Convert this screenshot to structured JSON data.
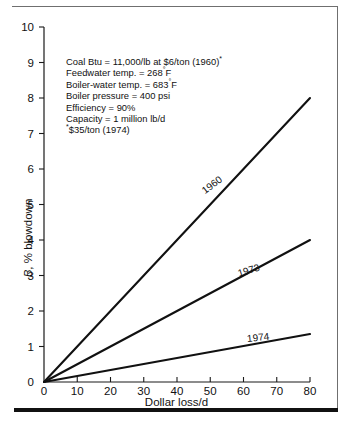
{
  "chart_data": {
    "type": "line",
    "title": "",
    "xlabel": "Dollar loss/d",
    "ylabel": "B, % blowdown",
    "ylabel_italic_prefix": "B",
    "ylabel_rest": ", % blowdown",
    "xlim": [
      0,
      80
    ],
    "ylim": [
      0,
      10
    ],
    "xticks": [
      0,
      10,
      20,
      30,
      40,
      50,
      60,
      70,
      80
    ],
    "yticks": [
      0,
      1,
      2,
      3,
      4,
      5,
      6,
      7,
      8,
      9,
      10
    ],
    "grid": false,
    "legend_position": "inline-along-lines",
    "series": [
      {
        "name": "1960",
        "x": [
          0,
          80
        ],
        "values": [
          0,
          8.0
        ],
        "slope_per_dollar": 0.1
      },
      {
        "name": "1973",
        "x": [
          0,
          80
        ],
        "values": [
          0,
          4.0
        ],
        "slope_per_dollar": 0.05
      },
      {
        "name": "1974",
        "x": [
          0,
          80
        ],
        "values": [
          0,
          1.35
        ],
        "slope_per_dollar": 0.0169
      }
    ]
  },
  "annotation": {
    "lines": [
      "Coal Btu = 11,000/lb at $6/ton (1960)",
      "Feedwater temp. = 268",
      "Boiler-water temp. = 683",
      "Boiler pressure = 400 psi",
      "Efficiency = 90%",
      "Capacity = 1 million lb/d",
      "$35/ton (1974)"
    ],
    "line1_text": "Coal Btu = 11,000/lb at $6/ton (1960)",
    "line1_sup": "*",
    "line2_text": "Feedwater temp. = 268",
    "line2_sup": "°",
    "line2_tail": "F",
    "line3_text": "Boiler-water temp. = 683",
    "line3_sup": "°",
    "line3_tail": "F",
    "line4_text": "Boiler pressure = 400 psi",
    "line5_text": "Efficiency = 90%",
    "line6_text": "Capacity = 1 million lb/d",
    "line7_sup": "*",
    "line7_text": "$35/ton (1974)"
  },
  "colors": {
    "line": "#111111",
    "axis": "#1a1a1a",
    "frame_thin": "#6f6f6f",
    "frame_thick": "#111111",
    "background": "#ffffff"
  }
}
